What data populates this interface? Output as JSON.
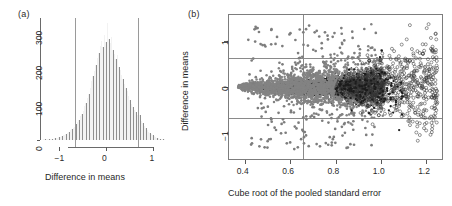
{
  "figure": {
    "panel_a_label": "(a)",
    "panel_b_label": "(b)"
  },
  "chart_data": [
    {
      "type": "bar",
      "panel": "(a)",
      "title": "",
      "xlabel": "Difference in means",
      "ylabel": "",
      "xlim": [
        -1.35,
        1.35
      ],
      "ylim": [
        0,
        345
      ],
      "xticks": [
        "-1",
        "0",
        "1"
      ],
      "xtick_values": [
        -1,
        0,
        1
      ],
      "yticks": [
        "0",
        "100",
        "200",
        "300"
      ],
      "ytick_values": [
        0,
        100,
        200,
        300
      ],
      "grid": false,
      "legend": "none",
      "bar_color": "#8e8e8e",
      "reference_lines": [
        -0.65,
        0.67
      ],
      "bin_width": 0.03,
      "bin_centers": [
        -1.32,
        -1.29,
        -1.26,
        -1.23,
        -1.2,
        -1.17,
        -1.14,
        -1.11,
        -1.08,
        -1.05,
        -1.02,
        -0.99,
        -0.96,
        -0.93,
        -0.9,
        -0.87,
        -0.84,
        -0.81,
        -0.78,
        -0.75,
        -0.72,
        -0.69,
        -0.66,
        -0.63,
        -0.6,
        -0.57,
        -0.54,
        -0.51,
        -0.48,
        -0.45,
        -0.42,
        -0.39,
        -0.36,
        -0.33,
        -0.3,
        -0.27,
        -0.24,
        -0.21,
        -0.18,
        -0.15,
        -0.12,
        -0.09,
        -0.06,
        -0.03,
        0,
        0.03,
        0.06,
        0.09,
        0.12,
        0.15,
        0.18,
        0.21,
        0.24,
        0.27,
        0.3,
        0.33,
        0.36,
        0.39,
        0.42,
        0.45,
        0.48,
        0.51,
        0.54,
        0.57,
        0.6,
        0.63,
        0.66,
        0.69,
        0.72,
        0.75,
        0.78,
        0.81,
        0.84,
        0.87,
        0.9,
        0.93,
        0.96,
        0.99,
        1.02,
        1.05,
        1.08,
        1.11,
        1.14,
        1.17,
        1.2,
        1.23
      ],
      "counts": [
        1,
        1,
        2,
        1,
        3,
        2,
        4,
        3,
        5,
        6,
        5,
        8,
        9,
        11,
        13,
        15,
        18,
        20,
        24,
        28,
        31,
        35,
        38,
        44,
        52,
        58,
        67,
        74,
        83,
        96,
        104,
        118,
        131,
        148,
        166,
        181,
        196,
        213,
        232,
        247,
        265,
        279,
        262,
        297,
        276,
        332,
        287,
        274,
        291,
        255,
        244,
        228,
        240,
        206,
        199,
        185,
        172,
        158,
        146,
        139,
        124,
        113,
        101,
        92,
        86,
        78,
        70,
        64,
        72,
        55,
        47,
        40,
        34,
        29,
        24,
        20,
        16,
        13,
        10,
        8,
        6,
        5,
        4,
        3,
        2,
        1
      ]
    },
    {
      "type": "scatter",
      "panel": "(b)",
      "title": "",
      "xlabel": "Cube root of the pooled standard error",
      "ylabel": "Difference in means",
      "xlim": [
        0.33,
        1.27
      ],
      "ylim": [
        -1.55,
        1.55
      ],
      "xticks": [
        "0.4",
        "0.6",
        "0.8",
        "1.0",
        "1.2"
      ],
      "xtick_values": [
        0.4,
        0.6,
        0.8,
        1.0,
        1.2
      ],
      "yticks": [
        "1",
        "0",
        "-1"
      ],
      "ytick_values": [
        1,
        0,
        -1
      ],
      "grid": false,
      "legend": "none",
      "reference_lines_h": [
        0.65,
        -0.65
      ],
      "reference_lines_v": [
        0.65
      ],
      "series": [
        {
          "name": "dense-core-filled-black",
          "marker": "filled-circle",
          "color": "#111111",
          "description": "dense black wedge widening from x=0.40 to x=1.0 within |y| < 0.18*(x-0.33)/0.2"
        },
        {
          "name": "scatter-filled-grey",
          "marker": "filled-circle",
          "color": "#808080",
          "description": "grey filled points forming funnel spread, x from 0.37 to 1.0"
        },
        {
          "name": "scatter-open-circle",
          "marker": "open-circle",
          "color": "#4a4a4a",
          "description": "open circles concentrated for x > 0.85 spreading to x=1.25"
        }
      ]
    }
  ]
}
